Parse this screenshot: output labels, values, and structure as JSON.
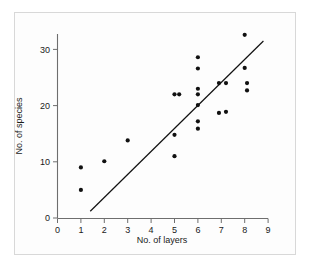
{
  "chart_data": {
    "type": "scatter",
    "title": "",
    "xlabel": "No. of layers",
    "ylabel": "No. of species",
    "xlim": [
      0,
      9.5
    ],
    "ylim": [
      0,
      34
    ],
    "xticks": [
      0,
      1,
      2,
      3,
      4,
      5,
      6,
      7,
      8,
      9
    ],
    "xtick_labels": [
      "0",
      "1",
      "2",
      "3",
      "4",
      "5",
      "6",
      "7",
      "8",
      "9"
    ],
    "yticks": [
      0,
      10,
      20,
      30
    ],
    "ytick_labels": [
      "0",
      "10",
      "20",
      "30"
    ],
    "grid": false,
    "legend": null,
    "marker_color": "#111111",
    "line_color": "#111111",
    "points": [
      {
        "x": 1.0,
        "y": 9.0
      },
      {
        "x": 1.0,
        "y": 5.0
      },
      {
        "x": 2.0,
        "y": 10.1
      },
      {
        "x": 3.0,
        "y": 13.8
      },
      {
        "x": 5.0,
        "y": 22.0
      },
      {
        "x": 5.2,
        "y": 22.0
      },
      {
        "x": 5.0,
        "y": 14.8
      },
      {
        "x": 5.0,
        "y": 11.0
      },
      {
        "x": 6.0,
        "y": 28.6
      },
      {
        "x": 6.0,
        "y": 26.6
      },
      {
        "x": 6.0,
        "y": 23.0
      },
      {
        "x": 6.0,
        "y": 22.0
      },
      {
        "x": 6.0,
        "y": 20.1
      },
      {
        "x": 6.0,
        "y": 17.2
      },
      {
        "x": 6.0,
        "y": 15.9
      },
      {
        "x": 6.9,
        "y": 24.0
      },
      {
        "x": 7.2,
        "y": 24.0
      },
      {
        "x": 6.9,
        "y": 18.7
      },
      {
        "x": 7.2,
        "y": 18.9
      },
      {
        "x": 8.0,
        "y": 32.6
      },
      {
        "x": 8.0,
        "y": 26.7
      },
      {
        "x": 8.1,
        "y": 24.0
      },
      {
        "x": 8.1,
        "y": 22.7
      }
    ],
    "fit_line": {
      "x_start": 1.4,
      "y_start": 1.2,
      "x_end": 8.8,
      "y_end": 31.5
    }
  }
}
